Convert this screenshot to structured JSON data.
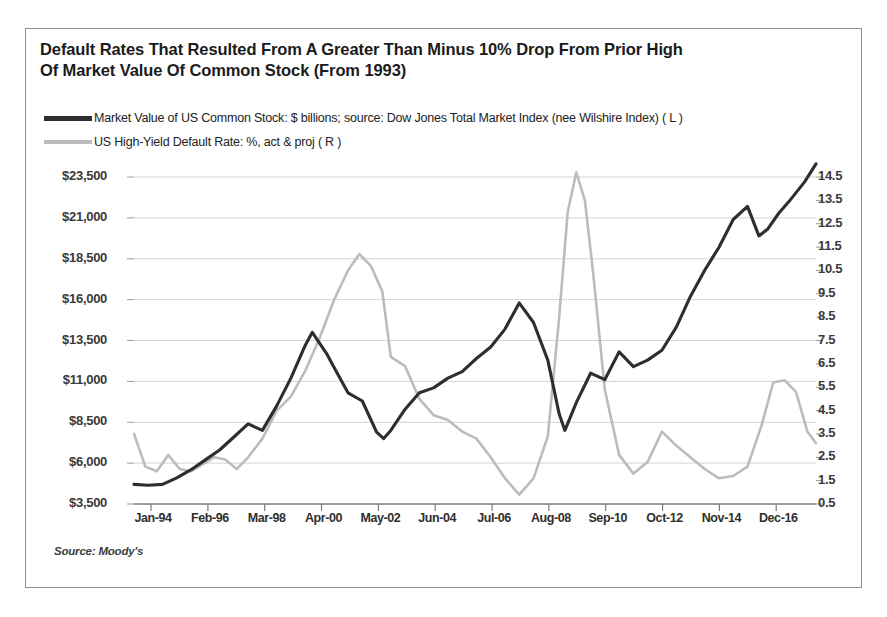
{
  "title": {
    "line1": "Default Rates That Resulted From A Greater Than Minus 10% Drop From Prior High",
    "line2": "Of Market Value Of Common Stock (From 1993)"
  },
  "legend": [
    {
      "label": "Market Value of US Common Stock: $ billions; source: Dow Jones Total Market Index (nee Wilshire Index)  ( L )",
      "color": "#2e2e2e",
      "style": "dark"
    },
    {
      "label": "US High-Yield Default Rate: %, act & proj ( R )",
      "color": "#bcbcbc",
      "style": "gray"
    }
  ],
  "source_note": "Source: Moody's",
  "chart_data": {
    "type": "line",
    "title": "Default Rates That Resulted From A Greater Than Minus 10% Drop From Prior High Of Market Value Of Common Stock (From 1993)",
    "xlabel": "",
    "grid": true,
    "legend_position": "top-left",
    "x_tick_labels": [
      "Jan-94",
      "Feb-96",
      "Mar-98",
      "Apr-00",
      "May-02",
      "Jun-04",
      "Jul-06",
      "Aug-08",
      "Sep-10",
      "Oct-12",
      "Nov-14",
      "Dec-16"
    ],
    "x_range": [
      "Jan-94",
      "Dec-17"
    ],
    "axes": [
      {
        "side": "left",
        "ylabel": "Market Value of US Common Stock ($ billions)",
        "ylim": [
          3500,
          23500
        ],
        "ticks": [
          "$3,500",
          "$6,000",
          "$8,500",
          "$11,000",
          "$13,500",
          "$16,000",
          "$18,500",
          "$21,000",
          "$23,500"
        ],
        "tick_values": [
          3500,
          6000,
          8500,
          11000,
          13500,
          16000,
          18500,
          21000,
          23500
        ]
      },
      {
        "side": "right",
        "ylabel": "US High-Yield Default Rate (%)",
        "ylim": [
          0.5,
          14.5
        ],
        "ticks": [
          "0.5",
          "1.5",
          "2.5",
          "3.5",
          "4.5",
          "5.5",
          "6.5",
          "7.5",
          "8.5",
          "9.5",
          "10.5",
          "11.5",
          "12.5",
          "13.5",
          "14.5"
        ],
        "tick_values": [
          0.5,
          1.5,
          2.5,
          3.5,
          4.5,
          5.5,
          6.5,
          7.5,
          8.5,
          9.5,
          10.5,
          11.5,
          12.5,
          13.5,
          14.5
        ]
      }
    ],
    "series": [
      {
        "name": "Market Value of US Common Stock: $ billions; source: Dow Jones Total Market Index (nee Wilshire Index)",
        "axis": "left",
        "color": "#2e2e2e",
        "unit": "$ billions",
        "x": [
          "1994.0",
          "1994.5",
          "1995.0",
          "1995.5",
          "1996.0",
          "1996.5",
          "1997.0",
          "1997.5",
          "1998.0",
          "1998.5",
          "1999.0",
          "1999.5",
          "2000.0",
          "2000.25",
          "2000.75",
          "2001.0",
          "2001.5",
          "2002.0",
          "2002.5",
          "2002.75",
          "2003.0",
          "2003.5",
          "2004.0",
          "2004.5",
          "2005.0",
          "2005.5",
          "2006.0",
          "2006.5",
          "2007.0",
          "2007.5",
          "2008.0",
          "2008.5",
          "2008.9",
          "2009.1",
          "2009.5",
          "2010.0",
          "2010.5",
          "2011.0",
          "2011.5",
          "2012.0",
          "2012.5",
          "2013.0",
          "2013.5",
          "2014.0",
          "2014.5",
          "2015.0",
          "2015.5",
          "2015.9",
          "2016.2",
          "2016.6",
          "2017.0",
          "2017.5",
          "2017.9"
        ],
        "values": [
          4700,
          4650,
          4700,
          5100,
          5600,
          6200,
          6800,
          7600,
          8400,
          8000,
          9500,
          11200,
          13200,
          14000,
          12700,
          11900,
          10300,
          9800,
          7900,
          7500,
          8000,
          9300,
          10300,
          10600,
          11200,
          11600,
          12400,
          13100,
          14200,
          15800,
          14600,
          12300,
          9000,
          8000,
          9700,
          11500,
          11100,
          12800,
          11900,
          12300,
          12900,
          14300,
          16200,
          17800,
          19200,
          20900,
          21700,
          19900,
          20300,
          21300,
          22100,
          23200,
          24300
        ]
      },
      {
        "name": "US High-Yield Default Rate: %, act & proj",
        "axis": "right",
        "color": "#bcbcbc",
        "unit": "%",
        "x": [
          "1994.0",
          "1994.4",
          "1994.8",
          "1995.2",
          "1995.6",
          "1996.0",
          "1996.4",
          "1996.8",
          "1997.2",
          "1997.6",
          "1998.0",
          "1998.5",
          "1999.0",
          "1999.5",
          "2000.0",
          "2000.5",
          "2001.0",
          "2001.5",
          "2001.9",
          "2002.3",
          "2002.7",
          "2003.0",
          "2003.5",
          "2004.0",
          "2004.5",
          "2005.0",
          "2005.5",
          "2006.0",
          "2006.5",
          "2007.0",
          "2007.5",
          "2008.0",
          "2008.5",
          "2008.9",
          "2009.2",
          "2009.5",
          "2009.8",
          "2010.1",
          "2010.5",
          "2011.0",
          "2011.5",
          "2012.0",
          "2012.5",
          "2013.0",
          "2013.5",
          "2014.0",
          "2014.5",
          "2015.0",
          "2015.5",
          "2016.0",
          "2016.4",
          "2016.8",
          "2017.2",
          "2017.6",
          "2017.9"
        ],
        "values": [
          3.5,
          2.1,
          1.9,
          2.6,
          2.0,
          1.9,
          2.2,
          2.5,
          2.4,
          2.0,
          2.5,
          3.3,
          4.5,
          5.1,
          6.2,
          7.6,
          9.2,
          10.5,
          11.2,
          10.7,
          9.6,
          6.8,
          6.4,
          5.0,
          4.3,
          4.1,
          3.6,
          3.3,
          2.5,
          1.6,
          0.9,
          1.6,
          3.4,
          8.5,
          13.0,
          14.7,
          13.5,
          10.3,
          5.4,
          2.6,
          1.8,
          2.3,
          3.6,
          3.0,
          2.5,
          2.0,
          1.6,
          1.7,
          2.1,
          3.9,
          5.7,
          5.8,
          5.3,
          3.6,
          3.1
        ]
      }
    ],
    "annotations": [
      {
        "text": "Source: Moody's",
        "position": "bottom-left"
      }
    ]
  },
  "colors": {
    "market_value_line": "#2e2e2e",
    "default_rate_line": "#bcbcbc",
    "grid": "#d4d4d4",
    "axis": "#8b8f96",
    "text": "#1b1b1b",
    "background": "#ffffff"
  }
}
